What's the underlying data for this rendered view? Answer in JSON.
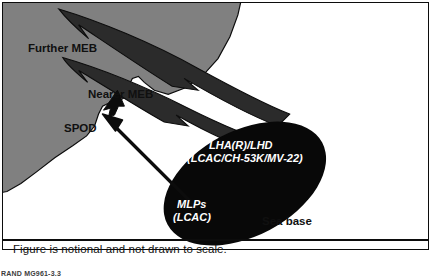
{
  "figure": {
    "caption": "Figure is notional and not drawn to scale.",
    "source": "RAND MG961-3.3",
    "colors": {
      "land": "#808080",
      "sea": "#ffffff",
      "movement_arrows": "#2b2b2b",
      "sea_base": "#080808",
      "outline": "#0c0c0c",
      "label_dark": "#101010",
      "label_light": "#ffffff"
    },
    "labels": {
      "further_meb": "Further MEB",
      "nearer_meb": "Nearer MEB",
      "spod": "SPOD",
      "lha_line1": "LHA(R)/LHD",
      "lha_line2": "(LCAC/CH-53K/MV-22)",
      "mlps_line1": "MLPs",
      "mlps_line2": "(LCAC)",
      "sea_base": "Sea base"
    }
  }
}
